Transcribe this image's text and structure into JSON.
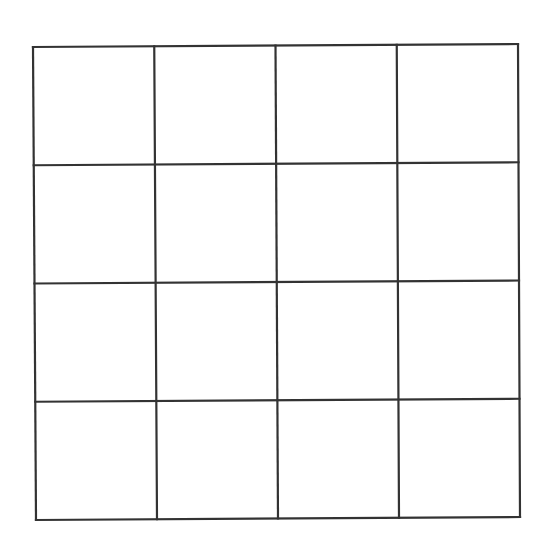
{
  "diagram": {
    "type": "grid",
    "rows": 4,
    "columns": 4,
    "cell_count": 16,
    "cells_content": [
      [
        "",
        "",
        "",
        ""
      ],
      [
        "",
        "",
        "",
        ""
      ],
      [
        "",
        "",
        "",
        ""
      ],
      [
        "",
        "",
        "",
        ""
      ]
    ],
    "corners": {
      "top_left": [
        33,
        47
      ],
      "top_right": [
        518,
        44
      ],
      "bottom_left": [
        36,
        520
      ],
      "bottom_right": [
        520,
        517
      ]
    },
    "line_color": "#333333",
    "background_color": "#ffffff"
  }
}
